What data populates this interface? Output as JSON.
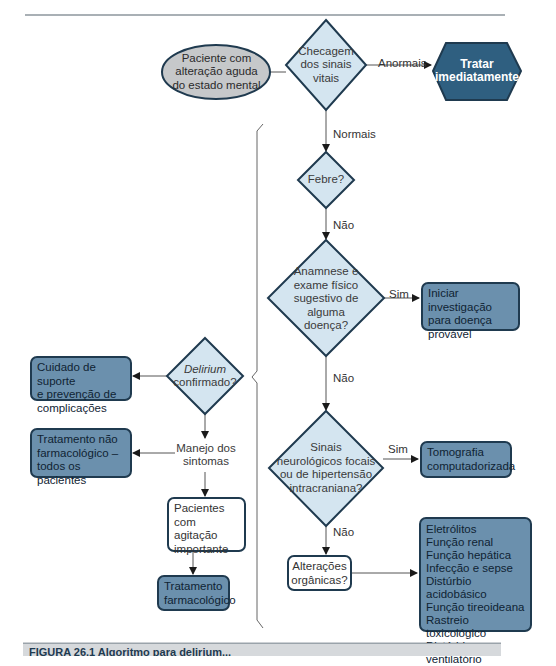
{
  "diagram": {
    "start": {
      "line1": "Paciente com",
      "line2": "alteração aguda",
      "line3": "do estado mental"
    },
    "vitals": {
      "line1": "Checagem",
      "line2": "dos sinais",
      "line3": "vitais"
    },
    "abnormal_label": "Anormais",
    "treat_now": {
      "line1": "Tratar",
      "line2": "imediatamente"
    },
    "normal_label": "Normais",
    "fever": {
      "text": "Febre?"
    },
    "fever_no_label": "Não",
    "history": {
      "line1": "Anamnese e",
      "line2": "exame físico",
      "line3": "sugestivo de",
      "line4": "alguma",
      "line5": "doença?"
    },
    "history_yes_label": "Sim",
    "investigate": {
      "line1": "Iniciar investigação",
      "line2": "para doença",
      "line3": "provável"
    },
    "history_no_label": "Não",
    "neuro": {
      "line1": "Sinais",
      "line2": "neurológicos focais",
      "line3": "ou de hipertensão",
      "line4": "intracraniana?"
    },
    "neuro_yes_label": "Sim",
    "ct": {
      "line1": "Tomografia",
      "line2": "computadorizada"
    },
    "neuro_no_label": "Não",
    "organic": {
      "line1": "Alterações",
      "line2": "orgânicas?"
    },
    "organic_items": [
      "Eletrólitos",
      "Função renal",
      "Função hepática",
      "Infecção e sepse",
      "Distúrbio acidobásico",
      "Função tireoideana",
      "Rastreio toxicológico",
      "Distúrbio ventilatório"
    ],
    "delirium": {
      "line1": "Delirium",
      "line2": "confirmado?"
    },
    "support": {
      "line1": "Cuidado de suporte",
      "line2": "e prevenção de",
      "line3": "complicações"
    },
    "symptoms": {
      "line1": "Manejo dos",
      "line2": "sintomas"
    },
    "nonpharm": {
      "line1": "Tratamento não",
      "line2": "farmacológico –",
      "line3": "todos os pacientes"
    },
    "agitation": {
      "line1": "Pacientes com",
      "line2": "agitação",
      "line3": "importante"
    },
    "pharm": {
      "line1": "Tratamento",
      "line2": "farmacológico"
    }
  },
  "caption": {
    "text": "FIGURA 26.1 Algoritmo para delirium..."
  },
  "colors": {
    "dark_fill": "#2f5f80",
    "mid_fill": "#6b90ad",
    "light_fill": "#d4e5f0",
    "ellipse_fill": "#c6c8ca",
    "stroke": "#1f3a4f"
  }
}
